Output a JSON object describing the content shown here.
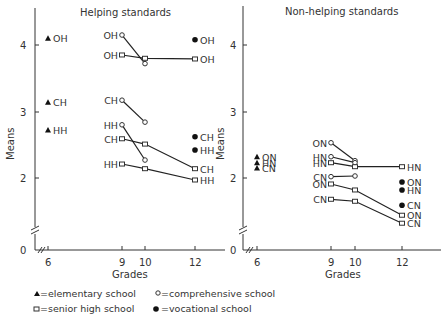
{
  "chart_data": [
    {
      "type": "line",
      "title": "Helping standards",
      "xlabel": "Grades",
      "ylabel": "Means",
      "x_ticks": [
        6,
        9,
        10,
        12
      ],
      "y_ticks": [
        0,
        2,
        3,
        4
      ],
      "ylim": [
        0,
        4.5
      ],
      "axis_break": true,
      "series": [
        {
          "label": "OH",
          "school": "elementary",
          "marker": "triangle",
          "points": [
            [
              6,
              4.1
            ]
          ]
        },
        {
          "label": "CH",
          "school": "elementary",
          "marker": "triangle",
          "points": [
            [
              6,
              3.14
            ]
          ]
        },
        {
          "label": "HH",
          "school": "elementary",
          "marker": "triangle",
          "points": [
            [
              6,
              2.72
            ]
          ]
        },
        {
          "label": "OH",
          "school": "comprehensive",
          "marker": "circle-open",
          "points": [
            [
              9,
              4.15
            ],
            [
              10,
              3.72
            ]
          ]
        },
        {
          "label": "CH",
          "school": "comprehensive",
          "marker": "circle-open",
          "points": [
            [
              9,
              3.17
            ],
            [
              10,
              2.84
            ]
          ]
        },
        {
          "label": "HH",
          "school": "comprehensive",
          "marker": "circle-open",
          "points": [
            [
              9,
              2.8
            ],
            [
              10,
              2.27
            ]
          ]
        },
        {
          "label": "OH",
          "school": "senior high",
          "marker": "square-open",
          "points": [
            [
              9,
              3.85
            ],
            [
              10,
              3.8
            ],
            [
              12,
              3.79
            ]
          ]
        },
        {
          "label": "CH",
          "school": "senior high",
          "marker": "square-open",
          "points": [
            [
              9,
              2.59
            ],
            [
              10,
              2.51
            ],
            [
              12,
              2.14
            ]
          ]
        },
        {
          "label": "HH",
          "school": "senior high",
          "marker": "square-open",
          "points": [
            [
              9,
              2.21
            ],
            [
              10,
              2.14
            ],
            [
              12,
              1.97
            ]
          ]
        },
        {
          "label": "OH",
          "school": "vocational",
          "marker": "circle-filled",
          "points": [
            [
              12,
              4.08
            ]
          ]
        },
        {
          "label": "CH",
          "school": "vocational",
          "marker": "circle-filled",
          "points": [
            [
              12,
              2.62
            ]
          ]
        },
        {
          "label": "HH",
          "school": "vocational",
          "marker": "circle-filled",
          "points": [
            [
              12,
              2.42
            ]
          ]
        }
      ]
    },
    {
      "type": "line",
      "title": "Non-helping standards",
      "xlabel": "Grades",
      "ylabel": "Means",
      "x_ticks": [
        6,
        9,
        10,
        12
      ],
      "y_ticks": [
        0,
        2,
        3,
        4
      ],
      "ylim": [
        0,
        4.5
      ],
      "axis_break": true,
      "series": [
        {
          "label": "ON",
          "school": "elementary",
          "marker": "triangle",
          "points": [
            [
              6,
              2.32
            ]
          ]
        },
        {
          "label": "HN",
          "school": "elementary",
          "marker": "triangle",
          "points": [
            [
              6,
              2.23
            ]
          ]
        },
        {
          "label": "CN",
          "school": "elementary",
          "marker": "triangle",
          "points": [
            [
              6,
              2.15
            ]
          ]
        },
        {
          "label": "ON",
          "school": "comprehensive",
          "marker": "circle-open",
          "points": [
            [
              9,
              2.53
            ],
            [
              10,
              2.26
            ]
          ]
        },
        {
          "label": "HN",
          "school": "comprehensive",
          "marker": "circle-open",
          "points": [
            [
              9,
              2.32
            ],
            [
              10,
              2.23
            ]
          ]
        },
        {
          "label": "CN",
          "school": "comprehensive",
          "marker": "circle-open",
          "points": [
            [
              9,
              2.02
            ],
            [
              10,
              2.03
            ]
          ]
        },
        {
          "label": "HN",
          "school": "senior high",
          "marker": "square-open",
          "points": [
            [
              9,
              2.23
            ],
            [
              10,
              2.17
            ],
            [
              12,
              2.17
            ]
          ]
        },
        {
          "label": "ON",
          "school": "senior high",
          "marker": "square-open",
          "points": [
            [
              9,
              1.91
            ],
            [
              10,
              1.82
            ],
            [
              12,
              1.44
            ]
          ]
        },
        {
          "label": "CN",
          "school": "senior high",
          "marker": "square-open",
          "points": [
            [
              9,
              1.68
            ],
            [
              10,
              1.65
            ],
            [
              12,
              1.32
            ]
          ]
        },
        {
          "label": "ON",
          "school": "vocational",
          "marker": "circle-filled",
          "points": [
            [
              12,
              1.94
            ]
          ]
        },
        {
          "label": "HN",
          "school": "vocational",
          "marker": "circle-filled",
          "points": [
            [
              12,
              1.82
            ]
          ]
        },
        {
          "label": "CN",
          "school": "vocational",
          "marker": "circle-filled",
          "points": [
            [
              12,
              1.59
            ]
          ]
        }
      ]
    }
  ],
  "legend": {
    "elementary": "=elementary school",
    "comprehensive": "=comprehensive school",
    "senior": "=senior high school",
    "vocational": "=vocational school"
  },
  "labels": {
    "left_title": "Helping standards",
    "right_title": "Non-helping standards",
    "xlabel": "Grades",
    "ylabel": "Means",
    "y4": "4",
    "y3": "3",
    "y2": "2",
    "y0": "0",
    "x6": "6",
    "x9": "9",
    "x10": "10",
    "x12": "12"
  }
}
